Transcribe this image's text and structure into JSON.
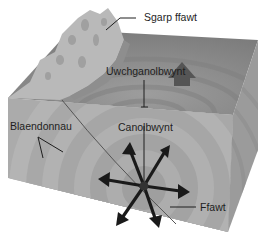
{
  "diagram": {
    "type": "earthquake block diagram",
    "labels": {
      "fault_scarp": "Sgarp ffawt",
      "epicentre": "Uwchganolbwynt",
      "wavefronts": "Blaendonnau",
      "focus": "Canolbwynt",
      "fault": "Ffawt"
    },
    "colors": {
      "top_face": "#8a8a8a",
      "front_face": "#a9a9a9",
      "side_face": "#9a9a9a",
      "scarp": "#b8b8b8",
      "arrow": "#1a1a1a",
      "line": "#1e1e1e"
    },
    "wave_ring_count": 8,
    "arrow_count": 8
  }
}
